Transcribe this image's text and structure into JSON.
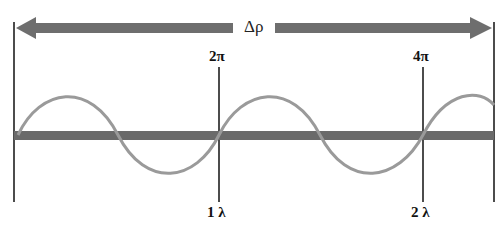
{
  "diagram": {
    "arrow_label": "Δρ",
    "top_markers": [
      "2π",
      "4π"
    ],
    "bottom_markers": [
      "1 λ",
      "2 λ"
    ],
    "colors": {
      "arrow": "#6e6e6e",
      "bar": "#6a6a6a",
      "wave": "#9a9a9a",
      "lines": "#111111"
    }
  }
}
